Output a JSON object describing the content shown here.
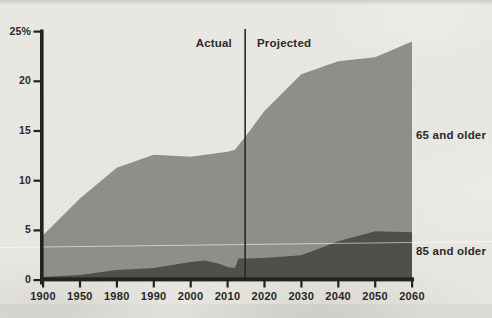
{
  "chart_data": {
    "type": "area",
    "title": "",
    "xlabel": "",
    "ylabel": "",
    "ylim": [
      0,
      25
    ],
    "grid": false,
    "y_tick_labels": [
      "25%",
      "20",
      "15",
      "10",
      "5",
      "0"
    ],
    "y_tick_values": [
      25,
      20,
      15,
      10,
      5,
      0
    ],
    "x_tick_labels": [
      "1900",
      "1950",
      "1980",
      "1990",
      "2000",
      "2010",
      "2020",
      "2030",
      "2040",
      "2050",
      "2060"
    ],
    "x_tick_years": [
      1900,
      1950,
      1980,
      1990,
      2000,
      2010,
      2020,
      2030,
      2040,
      2050,
      2060
    ],
    "x_axis_note": "tick spacing is equal between labeled years (non-linear in time)",
    "annotations": {
      "actual": "Actual",
      "projected": "Projected",
      "divider_year": 2015
    },
    "series_label_position": "right",
    "series": [
      {
        "name": "65 and older",
        "color": "#8f8e8b",
        "points": [
          [
            1900,
            4.5
          ],
          [
            1950,
            8.2
          ],
          [
            1980,
            11.3
          ],
          [
            1990,
            12.6
          ],
          [
            2000,
            12.4
          ],
          [
            2010,
            12.9
          ],
          [
            2012,
            13.1
          ],
          [
            2015,
            14.5
          ],
          [
            2020,
            17.0
          ],
          [
            2030,
            20.7
          ],
          [
            2040,
            22.0
          ],
          [
            2050,
            22.4
          ],
          [
            2060,
            24.0
          ]
        ]
      },
      {
        "name": "85 and older",
        "color": "#514f4c",
        "points": [
          [
            1900,
            0.3
          ],
          [
            1950,
            0.5
          ],
          [
            1980,
            1.0
          ],
          [
            1990,
            1.2
          ],
          [
            2000,
            1.8
          ],
          [
            2004,
            1.95
          ],
          [
            2008,
            1.6
          ],
          [
            2010,
            1.3
          ],
          [
            2012,
            1.2
          ],
          [
            2013,
            2.15
          ],
          [
            2015,
            2.15
          ],
          [
            2020,
            2.2
          ],
          [
            2030,
            2.5
          ],
          [
            2040,
            3.9
          ],
          [
            2050,
            4.9
          ],
          [
            2060,
            4.8
          ]
        ]
      }
    ],
    "colors": {
      "paper": "#e8e6e1",
      "axis": "#232220",
      "text": "#2b2a27",
      "divider_line": "#2a2927",
      "scan_artifact_line": "rgba(255,255,255,0.55)"
    }
  }
}
